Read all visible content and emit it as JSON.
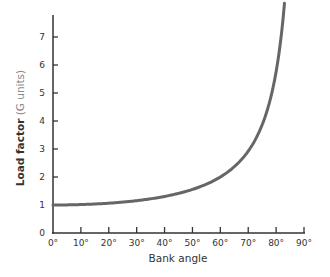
{
  "chart_data": {
    "type": "line",
    "title": "",
    "xlabel": "Bank angle",
    "ylabel": "Load factor",
    "ylabel_unit": "(G units)",
    "xlim": [
      0,
      90
    ],
    "ylim": [
      0,
      8
    ],
    "grid": false,
    "legend": null,
    "x_ticks": [
      "0°",
      "10°",
      "20°",
      "30°",
      "40°",
      "50°",
      "60°",
      "70°",
      "80°",
      "90°"
    ],
    "y_ticks": [
      "0",
      "1",
      "2",
      "3",
      "4",
      "5",
      "6",
      "7"
    ],
    "series": [
      {
        "name": "Load factor vs bank angle",
        "formula": "1/cos(bank angle)",
        "x": [
          0,
          10,
          20,
          30,
          40,
          50,
          60,
          70,
          75,
          80,
          82,
          83
        ],
        "y": [
          1.0,
          1.02,
          1.06,
          1.15,
          1.31,
          1.56,
          2.0,
          2.92,
          3.86,
          5.76,
          7.19,
          7.8
        ],
        "color": "#666666"
      }
    ]
  },
  "colors": {
    "axis": "#333333",
    "curve": "#666666",
    "unit_text": "#888888"
  }
}
